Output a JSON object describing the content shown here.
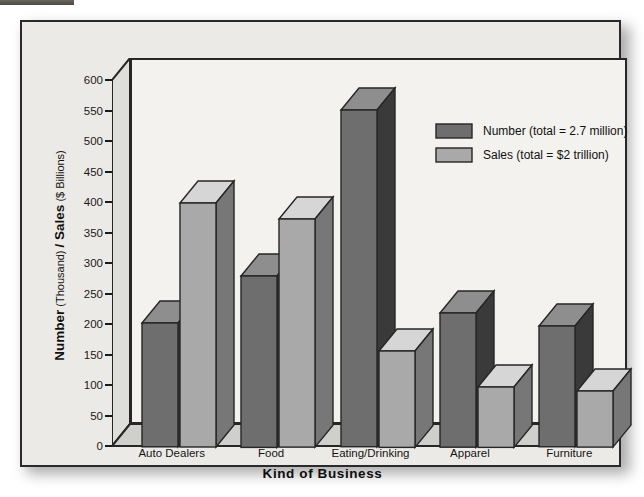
{
  "figure": {
    "x_title": "Kind of Business",
    "y_title_main1": "Number",
    "y_title_sub1": " (Thousand) ",
    "y_title_main2": "/ Sales",
    "y_title_sub2": " ($ Billions)"
  },
  "legend": {
    "position": "upper-right",
    "entries": [
      {
        "label": "Number (total = 2.7 million)",
        "color": "#6e6e6e",
        "name": "legend-number"
      },
      {
        "label": "Sales (total = $2 trillion)",
        "color": "#a9a9a9",
        "name": "legend-sales"
      }
    ]
  },
  "colors": {
    "number_face": "#6e6e6e",
    "number_side": "#3a3a3a",
    "number_top": "#8e8e8e",
    "sales_face": "#a9a9a9",
    "sales_side": "#777777",
    "sales_top": "#d6d6d6",
    "plot_bg": "#f3f2ef",
    "figure_bg": "#eceae6",
    "outline": "#262626"
  },
  "chart_data": {
    "type": "bar",
    "title": "",
    "xlabel": "Kind of Business",
    "ylabel": "Number (Thousand) / Sales ($ Billions)",
    "categories": [
      "Auto Dealers",
      "Food",
      "Eating/Drinking",
      "Apparel",
      "Furniture"
    ],
    "series": [
      {
        "name": "Number (total = 2.7 million)",
        "unit": "Thousand",
        "values": [
          203,
          281,
          552,
          220,
          198
        ]
      },
      {
        "name": "Sales (total = $2 trillion)",
        "unit": "$ Billions",
        "values": [
          400,
          374,
          158,
          99,
          92
        ]
      }
    ],
    "ylim": [
      0,
      600
    ],
    "yticks": [
      0,
      50,
      100,
      150,
      200,
      250,
      300,
      350,
      400,
      450,
      500,
      550,
      600
    ],
    "ytick_labels": [
      "0",
      "50",
      "100",
      "150",
      "200",
      "250",
      "300",
      "350",
      "400",
      "450",
      "500",
      "550",
      "600"
    ],
    "grid": false,
    "style": "3d-column"
  }
}
